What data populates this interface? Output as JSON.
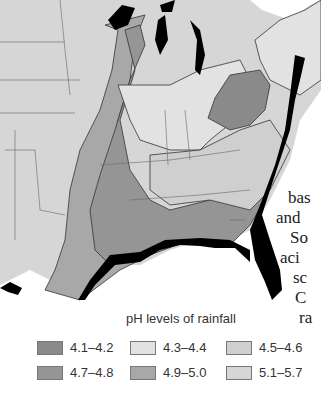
{
  "map": {
    "title": "pH levels of rainfall",
    "colors": {
      "ph_4_1_4_2": "#8a8a8a",
      "ph_4_3_4_4": "#e2e2e2",
      "ph_4_5_4_6": "#cfcfcf",
      "ph_4_7_4_8": "#959595",
      "ph_4_9_5_0": "#a8a8a8",
      "ph_5_1_5_7": "#d6d6d6",
      "coast": "#000000",
      "border": "#555555"
    },
    "legend": [
      {
        "label": "4.1–4.2",
        "color": "#8a8a8a"
      },
      {
        "label": "4.3–4.4",
        "color": "#e2e2e2"
      },
      {
        "label": "4.5–4.6",
        "color": "#cfcfcf"
      },
      {
        "label": "4.7–4.8",
        "color": "#959595"
      },
      {
        "label": "4.9–5.0",
        "color": "#a8a8a8"
      },
      {
        "label": "5.1–5.7",
        "color": "#d6d6d6"
      }
    ]
  },
  "side_text": [
    "bas",
    "and",
    "So",
    "aci",
    "sc",
    "C",
    "ra"
  ]
}
